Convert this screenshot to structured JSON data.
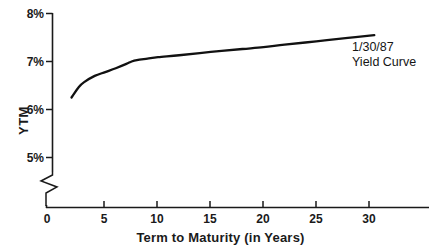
{
  "chart_data": {
    "type": "line",
    "title": "",
    "xlabel": "Term to Maturity (in Years)",
    "ylabel": "YTM",
    "xlim": [
      0,
      35.5
    ],
    "ylim": [
      4.6,
      8.0
    ],
    "grid": false,
    "legend_position": "none",
    "axis_break": "y-axis broken below 5%",
    "x_ticks": [
      {
        "value": 0,
        "label": "0"
      },
      {
        "value": 5,
        "label": "5"
      },
      {
        "value": 10,
        "label": "10"
      },
      {
        "value": 15,
        "label": "15"
      },
      {
        "value": 20,
        "label": "20"
      },
      {
        "value": 25,
        "label": "25"
      },
      {
        "value": 30,
        "label": "30"
      }
    ],
    "y_ticks": [
      {
        "value": 5,
        "label": "5%"
      },
      {
        "value": 6,
        "label": "6%"
      },
      {
        "value": 7,
        "label": "7%"
      },
      {
        "value": 8,
        "label": "8%"
      }
    ],
    "series": [
      {
        "name": "1/30/87 Yield Curve",
        "color": "#111111",
        "x": [
          1.8,
          2.5,
          3.0,
          4.0,
          5.0,
          6.0,
          7.0,
          7.5,
          8.0,
          9.0,
          10.0,
          12.0,
          15.0,
          18.0,
          20.0,
          22.0,
          25.0,
          28.0,
          30.5
        ],
        "values": [
          6.25,
          6.47,
          6.57,
          6.7,
          6.78,
          6.86,
          6.95,
          7.0,
          7.03,
          7.06,
          7.09,
          7.13,
          7.2,
          7.26,
          7.3,
          7.35,
          7.42,
          7.49,
          7.55
        ]
      }
    ],
    "annotations": [
      {
        "name": "curve-label",
        "line1": "1/30/87",
        "line2": "Yield Curve"
      }
    ]
  }
}
